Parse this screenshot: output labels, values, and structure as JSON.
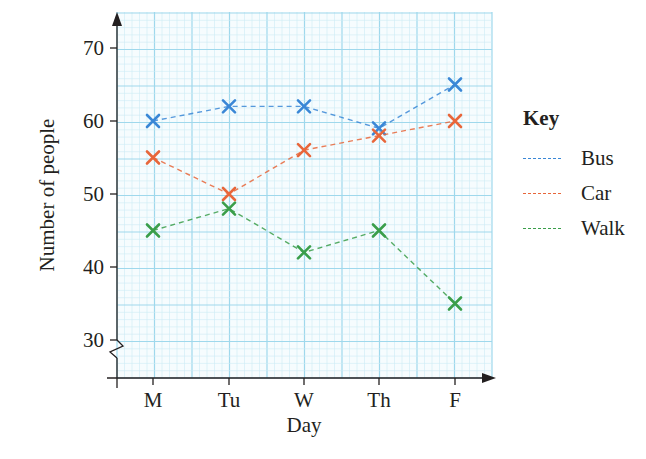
{
  "chart_data": {
    "type": "line",
    "title": "",
    "xlabel": "Day",
    "ylabel": "Number of people",
    "categories": [
      "M",
      "Tu",
      "W",
      "Th",
      "F"
    ],
    "yticks": [
      30,
      40,
      50,
      60,
      70
    ],
    "ylim": [
      25,
      75
    ],
    "y_axis_break": true,
    "grid": true,
    "legend_position": "right",
    "legend_title": "Key",
    "marker": "x",
    "line_style": "dashed",
    "series": [
      {
        "name": "Bus",
        "color": "#3a87d6",
        "values": [
          60,
          62,
          62,
          59,
          65
        ]
      },
      {
        "name": "Car",
        "color": "#e8663a",
        "values": [
          55,
          50,
          56,
          58,
          60
        ]
      },
      {
        "name": "Walk",
        "color": "#3a9e4a",
        "values": [
          45,
          48,
          42,
          45,
          35
        ]
      }
    ]
  },
  "key": {
    "title": "Key",
    "items": [
      {
        "label": "Bus",
        "color": "#3a87d6"
      },
      {
        "label": "Car",
        "color": "#e8663a"
      },
      {
        "label": "Walk",
        "color": "#3a9e4a"
      }
    ]
  },
  "colors": {
    "grid_major": "#9fd8ec",
    "grid_minor": "#cdebf5",
    "axis": "#231f20"
  }
}
